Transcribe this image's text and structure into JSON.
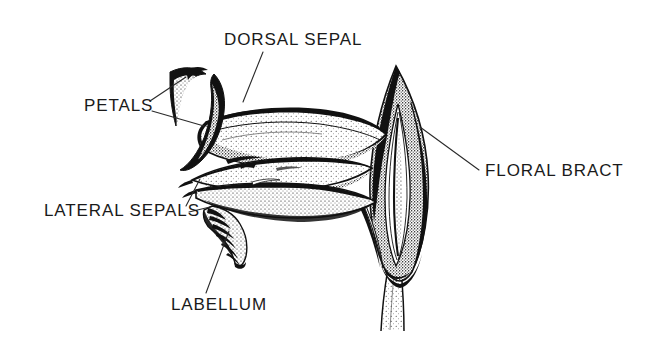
{
  "figure": {
    "background_color": "#ffffff",
    "ink_color": "#111111",
    "leader_line_color": "#2a2a2a"
  },
  "labels": [
    {
      "id": "dorsal-sepal",
      "text": "DORSAL SEPAL",
      "x": 224,
      "y": 31
    },
    {
      "id": "petals",
      "text": "PETALS",
      "x": 84,
      "y": 97
    },
    {
      "id": "lateral-sepals",
      "text": "LATERAL SEPALS",
      "x": 44,
      "y": 202
    },
    {
      "id": "labellum",
      "text": "LABELLUM",
      "x": 171,
      "y": 296
    },
    {
      "id": "floral-bract",
      "text": "FLORAL BRACT",
      "x": 485,
      "y": 162
    }
  ],
  "parts": [
    {
      "id": "dorsal-sepal",
      "name": "dorsal sepal"
    },
    {
      "id": "petals",
      "name": "petals"
    },
    {
      "id": "lateral-sepals",
      "name": "lateral sepals"
    },
    {
      "id": "labellum",
      "name": "labellum"
    },
    {
      "id": "floral-bract",
      "name": "floral bract"
    },
    {
      "id": "stem",
      "name": "stem"
    }
  ]
}
